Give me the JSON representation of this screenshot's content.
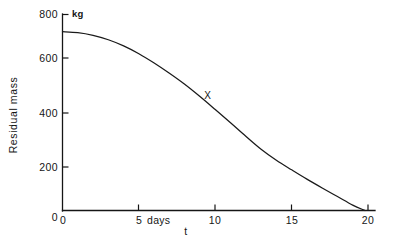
{
  "chart_data": {
    "type": "line",
    "title": "",
    "xlabel": "t",
    "ylabel": "Residual mass",
    "y_unit": "kg",
    "x_unit_label": "5 days",
    "xlim": [
      0,
      20.5
    ],
    "ylim": [
      0,
      800
    ],
    "grid": false,
    "legend": null,
    "x_ticks": [
      0,
      5,
      10,
      15,
      20
    ],
    "x_tick_labels": [
      "0",
      "5",
      "10",
      "15",
      "20"
    ],
    "y_ticks": [
      0,
      200,
      400,
      600,
      800
    ],
    "y_tick_labels": [
      "0",
      "200",
      "400",
      "600",
      "800"
    ],
    "annotations": [
      {
        "text": "X",
        "x": 9.5,
        "y": 455
      }
    ],
    "series": [
      {
        "name": "residual mass",
        "x": [
          0,
          1,
          2,
          3,
          4,
          5,
          6,
          7,
          8,
          9,
          10,
          11,
          12,
          13,
          14,
          15,
          16,
          17,
          18,
          19,
          19.8
        ],
        "values": [
          730,
          726,
          715,
          697,
          672,
          640,
          602,
          560,
          515,
          465,
          412,
          358,
          303,
          250,
          205,
          166,
          128,
          92,
          57,
          22,
          0
        ]
      }
    ]
  },
  "labels": {
    "y_axis_title": "Residual mass",
    "y_axis_unit": "kg",
    "x_axis_title": "t",
    "x_days_label": "5 days",
    "curve_marker": "X"
  }
}
